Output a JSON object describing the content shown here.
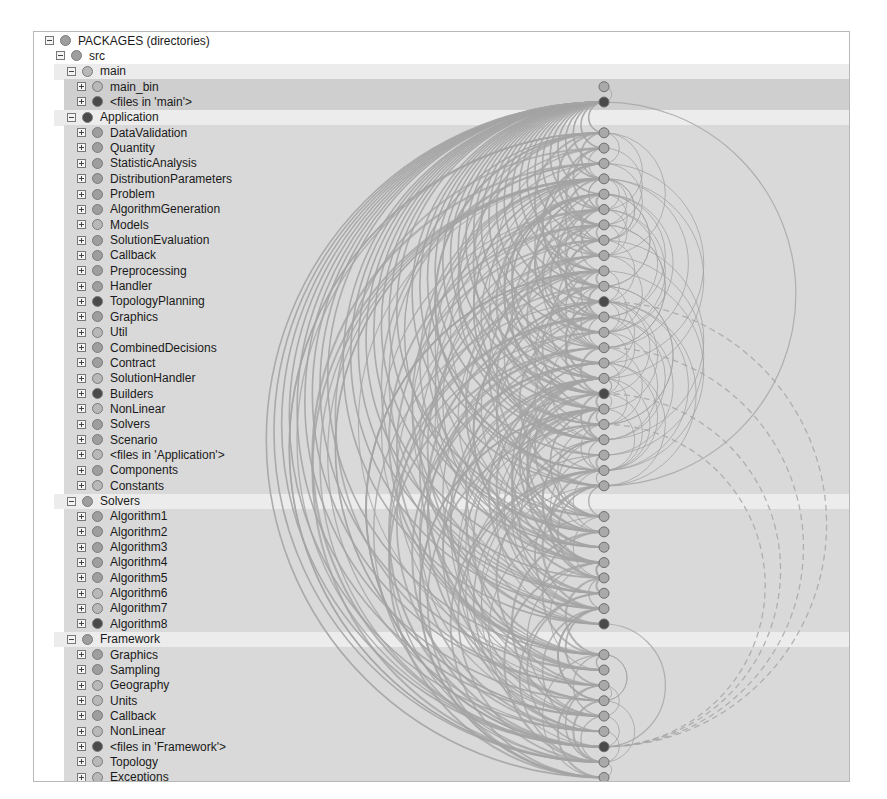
{
  "title": "PACKAGES (directories)",
  "colors": {
    "light_node": "#b8b8b8",
    "mid_node": "#9e9e9e",
    "dark_node": "#4a4a4a",
    "edge": "#a4a4a4",
    "band_light": "#e8e8e8",
    "band_mid": "#d9d9d9",
    "band_dark": "#cfcfcf",
    "group_header": "#ececec"
  },
  "tree": [
    {
      "label": "PACKAGES (directories)",
      "level": 0,
      "toggle": "minus",
      "node": "mid"
    },
    {
      "label": "src",
      "level": 1,
      "toggle": "minus",
      "node": "mid"
    },
    {
      "label": "main",
      "level": 2,
      "toggle": "minus",
      "node": "light"
    },
    {
      "label": "main_bin",
      "level": 3,
      "toggle": "plus",
      "node": "light"
    },
    {
      "label": "<files in 'main'>",
      "level": 3,
      "toggle": "plus",
      "node": "dark"
    },
    {
      "label": "Application",
      "level": 2,
      "toggle": "minus",
      "node": "dark"
    },
    {
      "label": "DataValidation",
      "level": 3,
      "toggle": "plus",
      "node": "mid"
    },
    {
      "label": "Quantity",
      "level": 3,
      "toggle": "plus",
      "node": "mid"
    },
    {
      "label": "StatisticAnalysis",
      "level": 3,
      "toggle": "plus",
      "node": "mid"
    },
    {
      "label": "DistributionParameters",
      "level": 3,
      "toggle": "plus",
      "node": "mid"
    },
    {
      "label": "Problem",
      "level": 3,
      "toggle": "plus",
      "node": "mid"
    },
    {
      "label": "AlgorithmGeneration",
      "level": 3,
      "toggle": "plus",
      "node": "mid"
    },
    {
      "label": "Models",
      "level": 3,
      "toggle": "plus",
      "node": "light"
    },
    {
      "label": "SolutionEvaluation",
      "level": 3,
      "toggle": "plus",
      "node": "mid"
    },
    {
      "label": "Callback",
      "level": 3,
      "toggle": "plus",
      "node": "mid"
    },
    {
      "label": "Preprocessing",
      "level": 3,
      "toggle": "plus",
      "node": "mid"
    },
    {
      "label": "Handler",
      "level": 3,
      "toggle": "plus",
      "node": "mid"
    },
    {
      "label": "TopologyPlanning",
      "level": 3,
      "toggle": "plus",
      "node": "dark"
    },
    {
      "label": "Graphics",
      "level": 3,
      "toggle": "plus",
      "node": "mid"
    },
    {
      "label": "Util",
      "level": 3,
      "toggle": "plus",
      "node": "light"
    },
    {
      "label": "CombinedDecisions",
      "level": 3,
      "toggle": "plus",
      "node": "mid"
    },
    {
      "label": "Contract",
      "level": 3,
      "toggle": "plus",
      "node": "mid"
    },
    {
      "label": "SolutionHandler",
      "level": 3,
      "toggle": "plus",
      "node": "light"
    },
    {
      "label": "Builders",
      "level": 3,
      "toggle": "plus",
      "node": "dark"
    },
    {
      "label": "NonLinear",
      "level": 3,
      "toggle": "plus",
      "node": "light"
    },
    {
      "label": "Solvers",
      "level": 3,
      "toggle": "plus",
      "node": "mid"
    },
    {
      "label": "Scenario",
      "level": 3,
      "toggle": "plus",
      "node": "mid"
    },
    {
      "label": "<files in 'Application'>",
      "level": 3,
      "toggle": "plus",
      "node": "light"
    },
    {
      "label": "Components",
      "level": 3,
      "toggle": "plus",
      "node": "mid"
    },
    {
      "label": "Constants",
      "level": 3,
      "toggle": "plus",
      "node": "light"
    },
    {
      "label": "Solvers",
      "level": 2,
      "toggle": "minus",
      "node": "mid"
    },
    {
      "label": "Algorithm1",
      "level": 3,
      "toggle": "plus",
      "node": "mid"
    },
    {
      "label": "Algorithm2",
      "level": 3,
      "toggle": "plus",
      "node": "mid"
    },
    {
      "label": "Algorithm3",
      "level": 3,
      "toggle": "plus",
      "node": "mid"
    },
    {
      "label": "Algorithm4",
      "level": 3,
      "toggle": "plus",
      "node": "mid"
    },
    {
      "label": "Algorithm5",
      "level": 3,
      "toggle": "plus",
      "node": "mid"
    },
    {
      "label": "Algorithm6",
      "level": 3,
      "toggle": "plus",
      "node": "light"
    },
    {
      "label": "Algorithm7",
      "level": 3,
      "toggle": "plus",
      "node": "light"
    },
    {
      "label": "Algorithm8",
      "level": 3,
      "toggle": "plus",
      "node": "dark"
    },
    {
      "label": "Framework",
      "level": 2,
      "toggle": "minus",
      "node": "mid"
    },
    {
      "label": "Graphics",
      "level": 3,
      "toggle": "plus",
      "node": "mid"
    },
    {
      "label": "Sampling",
      "level": 3,
      "toggle": "plus",
      "node": "mid"
    },
    {
      "label": "Geography",
      "level": 3,
      "toggle": "plus",
      "node": "light"
    },
    {
      "label": "Units",
      "level": 3,
      "toggle": "plus",
      "node": "light"
    },
    {
      "label": "Callback",
      "level": 3,
      "toggle": "plus",
      "node": "mid"
    },
    {
      "label": "NonLinear",
      "level": 3,
      "toggle": "plus",
      "node": "light"
    },
    {
      "label": "<files in 'Framework'>",
      "level": 3,
      "toggle": "plus",
      "node": "dark"
    },
    {
      "label": "Topology",
      "level": 3,
      "toggle": "plus",
      "node": "light"
    },
    {
      "label": "Exceptions",
      "level": 3,
      "toggle": "plus",
      "node": "light"
    }
  ]
}
